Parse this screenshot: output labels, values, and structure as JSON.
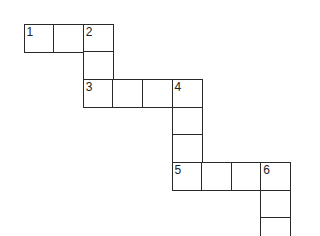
{
  "crossword": {
    "origin_x": 23.5,
    "origin_y": 23.5,
    "cell_w": 29.6,
    "cell_h": 27.7,
    "cells": [
      {
        "col": 0,
        "row": 0,
        "number": "1"
      },
      {
        "col": 1,
        "row": 0,
        "number": ""
      },
      {
        "col": 2,
        "row": 0,
        "number": "2"
      },
      {
        "col": 2,
        "row": 1,
        "number": ""
      },
      {
        "col": 2,
        "row": 2,
        "number": "3"
      },
      {
        "col": 3,
        "row": 2,
        "number": ""
      },
      {
        "col": 4,
        "row": 2,
        "number": ""
      },
      {
        "col": 5,
        "row": 2,
        "number": "4"
      },
      {
        "col": 5,
        "row": 3,
        "number": ""
      },
      {
        "col": 5,
        "row": 4,
        "number": ""
      },
      {
        "col": 5,
        "row": 5,
        "number": "5"
      },
      {
        "col": 6,
        "row": 5,
        "number": ""
      },
      {
        "col": 7,
        "row": 5,
        "number": ""
      },
      {
        "col": 8,
        "row": 5,
        "number": "6"
      },
      {
        "col": 8,
        "row": 6,
        "number": ""
      },
      {
        "col": 8,
        "row": 7,
        "number": ""
      }
    ]
  }
}
